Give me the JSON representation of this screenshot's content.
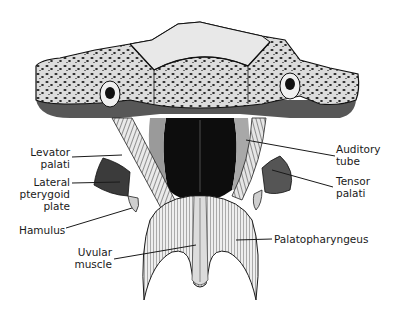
{
  "figure": {
    "labels": {
      "levator_palati": {
        "line1": "Levator",
        "line2": "palati"
      },
      "lateral_pterygoid_plate": {
        "line1": "Lateral",
        "line2": "pterygoid",
        "line3": "plate"
      },
      "hamulus": {
        "line1": "Hamulus"
      },
      "uvular_muscle": {
        "line1": "Uvular",
        "line2": "muscle"
      },
      "auditory_tube": {
        "line1": "Auditory",
        "line2": "tube"
      },
      "tensor_palati": {
        "line1": "Tensor",
        "line2": "palati"
      },
      "palatopharyngeus": {
        "line1": "Palatopharyngeus"
      }
    },
    "colors": {
      "ink": "#1a1a1a",
      "bone_light": "#e6e6e6",
      "bone_spots": "#2a2a2a",
      "shadow": "#3a3a3a",
      "cavity": "#0d0d0d",
      "background": "#ffffff"
    }
  }
}
